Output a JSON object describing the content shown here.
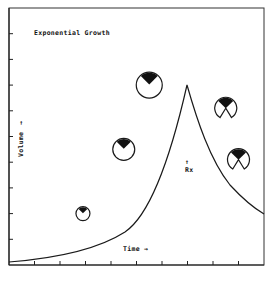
{
  "diagram": {
    "title": "Exponential Growth",
    "y_label": "Volume",
    "y_arrow": "→",
    "x_label": "Time",
    "x_arrow": "→",
    "treatment_marker": {
      "arrow": "↑",
      "label": "Rx"
    },
    "x_tick_count": 9,
    "y_tick_count": 9,
    "curve": {
      "description": "Exponential rise to a peak, then decline after treatment (Rx)",
      "shape": "rise-peak-decline"
    },
    "glyphs": [
      {
        "id": "glyph-1",
        "stage": 1,
        "type": "circle-with-wedge",
        "relative_size": "small",
        "time_index": 2.9,
        "volume_index": 2.0
      },
      {
        "id": "glyph-2",
        "stage": 2,
        "type": "circle-with-wedge",
        "relative_size": "medium",
        "time_index": 4.5,
        "volume_index": 4.5
      },
      {
        "id": "glyph-3",
        "stage": 3,
        "type": "circle-with-wedge",
        "relative_size": "large",
        "time_index": 5.5,
        "volume_index": 7.0
      },
      {
        "id": "glyph-4",
        "stage": 4,
        "type": "notched-circle-with-wedge",
        "relative_size": "medium",
        "time_index": 8.5,
        "volume_index": 6.1
      },
      {
        "id": "glyph-5",
        "stage": 5,
        "type": "notched-circle-with-wedge",
        "relative_size": "medium",
        "time_index": 9.0,
        "volume_index": 4.1
      }
    ]
  }
}
